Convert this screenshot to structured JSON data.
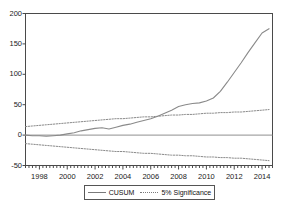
{
  "chart_data": {
    "type": "line",
    "title": "",
    "xlabel": "",
    "ylabel": "",
    "xlim": [
      1997.0,
      2014.75
    ],
    "ylim": [
      -50,
      200
    ],
    "grid": false,
    "zero_line": 0,
    "legend_position": "below-axis-center",
    "y_ticks": [
      "200",
      "150",
      "100",
      "50",
      "0",
      "-50"
    ],
    "y_tick_values": [
      200,
      150,
      100,
      50,
      0,
      -50
    ],
    "x_ticks": [
      "1998",
      "2000",
      "2002",
      "2004",
      "2006",
      "2008",
      "2010",
      "2012",
      "2014"
    ],
    "x_tick_values": [
      1998,
      2000,
      2002,
      2004,
      2006,
      2008,
      2010,
      2012,
      2014
    ],
    "x": [
      1997.0,
      1997.5,
      1998.0,
      1998.5,
      1999.0,
      1999.5,
      2000.0,
      2000.5,
      2001.0,
      2001.5,
      2002.0,
      2002.5,
      2003.0,
      2003.5,
      2004.0,
      2004.5,
      2005.0,
      2005.5,
      2006.0,
      2006.5,
      2007.0,
      2007.5,
      2008.0,
      2008.5,
      2009.0,
      2009.5,
      2010.0,
      2010.5,
      2011.0,
      2011.5,
      2012.0,
      2012.5,
      2013.0,
      2013.5,
      2014.0,
      2014.5
    ],
    "series": [
      {
        "name": "CUSUM",
        "style": "solid",
        "color": "#8a8a8a",
        "values": [
          0,
          -1,
          -1,
          -2,
          -1,
          0,
          2,
          4,
          7,
          9,
          11,
          12,
          10,
          13,
          16,
          18,
          21,
          24,
          27,
          31,
          36,
          41,
          47,
          50,
          52,
          53,
          56,
          61,
          72,
          87,
          103,
          119,
          136,
          152,
          168,
          175
        ]
      },
      {
        "name": "5% Significance",
        "style": "dotted",
        "color": "#8a8a8a",
        "band": "upper",
        "values": [
          14,
          15,
          16,
          17,
          18,
          19,
          20,
          21,
          22,
          23,
          24,
          25,
          26,
          27,
          27,
          28,
          29,
          30,
          30,
          31,
          32,
          33,
          33,
          34,
          34,
          35,
          36,
          36,
          37,
          37,
          38,
          38,
          39,
          40,
          41,
          42
        ]
      },
      {
        "name": "5% Significance",
        "style": "dotted",
        "color": "#8a8a8a",
        "band": "lower",
        "values": [
          -14,
          -15,
          -16,
          -17,
          -18,
          -19,
          -20,
          -21,
          -22,
          -23,
          -24,
          -25,
          -26,
          -27,
          -27,
          -28,
          -29,
          -30,
          -30,
          -31,
          -32,
          -33,
          -33,
          -34,
          -34,
          -35,
          -36,
          -36,
          -37,
          -37,
          -38,
          -38,
          -39,
          -40,
          -41,
          -42
        ]
      }
    ]
  },
  "legend": {
    "items": [
      {
        "label": "CUSUM",
        "style": "solid"
      },
      {
        "label": "5% Significance",
        "style": "dotted"
      }
    ]
  },
  "colors": {
    "line": "#8a8a8a",
    "axis": "#4a4a4a",
    "text": "#1a1a1a",
    "background": "#ffffff"
  }
}
